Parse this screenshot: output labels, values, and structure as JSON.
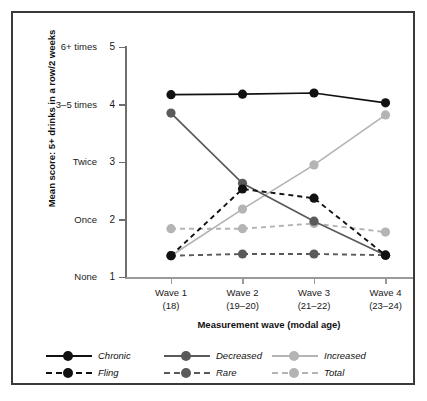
{
  "chart_data": {
    "type": "line",
    "title": "",
    "xlabel": "Measurement wave (modal age)",
    "ylabel": "Mean score: 5+ drinks in a row/2 weeks",
    "categories": [
      "Wave 1",
      "Wave 2",
      "Wave 3",
      "Wave 4"
    ],
    "category_sublabels": [
      "(18)",
      "(19–20)",
      "(21–22)",
      "(23–24)"
    ],
    "ylim": [
      1,
      5
    ],
    "yticks": [
      1,
      2,
      3,
      4,
      5
    ],
    "ytick_labels": [
      "1",
      "2",
      "3",
      "4",
      "5"
    ],
    "ytick_words": [
      "None",
      "Once",
      "Twice",
      "3–5 times",
      "6+ times"
    ],
    "grid": false,
    "legend_position": "bottom-left",
    "series": [
      {
        "name": "Chronic",
        "values": [
          4.17,
          4.18,
          4.2,
          4.03
        ],
        "color": "#111111",
        "dash": "solid"
      },
      {
        "name": "Decreased",
        "values": [
          3.85,
          2.63,
          1.97,
          1.38
        ],
        "color": "#5a5a5a",
        "dash": "solid"
      },
      {
        "name": "Increased",
        "values": [
          1.37,
          2.18,
          2.95,
          3.82
        ],
        "color": "#b4b4b4",
        "dash": "solid"
      },
      {
        "name": "Fling",
        "values": [
          1.37,
          2.53,
          2.37,
          1.38
        ],
        "color": "#111111",
        "dash": "dashed"
      },
      {
        "name": "Rare",
        "values": [
          1.37,
          1.4,
          1.4,
          1.38
        ],
        "color": "#5a5a5a",
        "dash": "dashed"
      },
      {
        "name": "Total",
        "values": [
          1.84,
          1.84,
          1.93,
          1.78
        ],
        "color": "#b4b4b4",
        "dash": "dashed"
      }
    ]
  },
  "legend": {
    "entries": [
      {
        "label": "Chronic",
        "color": "#111111",
        "dash": "solid"
      },
      {
        "label": "Decreased",
        "color": "#5a5a5a",
        "dash": "solid"
      },
      {
        "label": "Increased",
        "color": "#b4b4b4",
        "dash": "solid"
      },
      {
        "label": "Fling",
        "color": "#111111",
        "dash": "dashed"
      },
      {
        "label": "Rare",
        "color": "#5a5a5a",
        "dash": "dashed"
      },
      {
        "label": "Total",
        "color": "#b4b4b4",
        "dash": "dashed"
      }
    ]
  },
  "colors": {
    "dark": "#111111",
    "mid": "#5a5a5a",
    "light": "#b4b4b4",
    "axis": "#6e6e6e",
    "frame": "#3a3a3a",
    "background": "#ffffff"
  }
}
